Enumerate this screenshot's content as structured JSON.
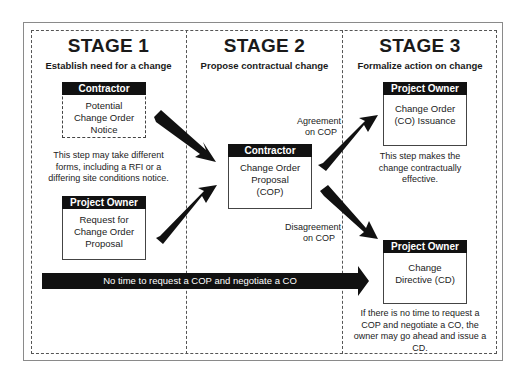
{
  "stages": [
    {
      "title": "STAGE 1",
      "subtitle": "Establish need for a change",
      "boxes": [
        {
          "header": "Contractor",
          "body": [
            "Potential",
            "Change Order",
            "Notice"
          ],
          "border": "dashed"
        },
        {
          "header": "Project Owner",
          "body": [
            "Request for",
            "Change Order",
            "Proposal"
          ],
          "border": "solid"
        }
      ],
      "note": [
        "This step may take different",
        "forms, including a RFI or a",
        "differing site conditions notice."
      ]
    },
    {
      "title": "STAGE 2",
      "subtitle": "Propose contractual change",
      "boxes": [
        {
          "header": "Contractor",
          "body": [
            "Change Order",
            "Proposal",
            "(COP)"
          ],
          "border": "solid"
        }
      ],
      "labels": {
        "agreement": [
          "Agreement",
          "on COP"
        ],
        "disagreement": [
          "Disagreement",
          "on COP"
        ]
      }
    },
    {
      "title": "STAGE 3",
      "subtitle": "Formalize action on change",
      "boxes": [
        {
          "header": "Project Owner",
          "body": [
            "Change Order",
            "(CO) Issuance"
          ],
          "border": "solid"
        },
        {
          "header": "Project Owner",
          "body": [
            "Change",
            "Directive (CD)"
          ],
          "border": "solid"
        }
      ],
      "notes": [
        [
          "This step makes the",
          "change contractually",
          "effective."
        ],
        [
          "If there is no time to request a",
          "COP and negotiate a CO, the",
          "owner may go ahead and issue a",
          "CD."
        ]
      ]
    }
  ],
  "bypass_arrow": {
    "label": "No time to request a COP and negotiate a CO"
  },
  "colors": {
    "arrow": "#111111",
    "header_bg": "#111111",
    "header_text": "#ffffff",
    "border": "#444444"
  }
}
